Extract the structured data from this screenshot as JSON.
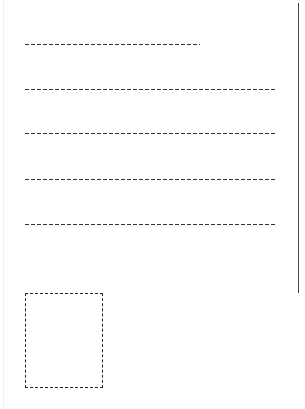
{
  "postcard": {
    "address_lines": [
      {
        "id": "line-1",
        "x": 25,
        "y": 44,
        "width": 175
      },
      {
        "id": "line-2",
        "x": 25,
        "y": 89,
        "width": 252
      },
      {
        "id": "line-3",
        "x": 25,
        "y": 133,
        "width": 252
      },
      {
        "id": "line-4",
        "x": 25,
        "y": 179,
        "width": 252
      },
      {
        "id": "line-5",
        "x": 25,
        "y": 224,
        "width": 252
      }
    ],
    "stamp_box": {
      "x": 25,
      "y": 293,
      "width": 78,
      "height": 95
    },
    "divider": {
      "x": 298,
      "y": 3,
      "height": 290
    },
    "colors": {
      "line": "#333333",
      "divider": "#444444",
      "background": "#ffffff"
    }
  }
}
